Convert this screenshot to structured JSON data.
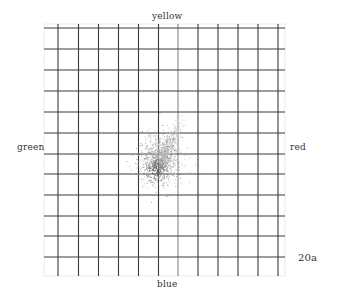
{
  "chart_data": {
    "type": "scatter",
    "title": "",
    "figure_label": "20a",
    "axis_labels": {
      "top": "yellow",
      "bottom": "blue",
      "left": "green",
      "right": "red"
    },
    "grid": true,
    "grid_cells": {
      "columns": 12,
      "rows": 12
    },
    "xlim": [
      -6,
      6
    ],
    "ylim": [
      -6,
      6
    ],
    "cluster": {
      "center": [
        0.3,
        -0.6
      ],
      "extent_x": [
        -1.5,
        1.7
      ],
      "extent_y": [
        -2.3,
        1.9
      ],
      "streak": {
        "from": [
          0.3,
          0
        ],
        "to": [
          1.3,
          1.8
        ]
      }
    }
  },
  "labels": {
    "top": "yellow",
    "bottom": "blue",
    "left": "green",
    "right": "red",
    "figure": "20a"
  }
}
